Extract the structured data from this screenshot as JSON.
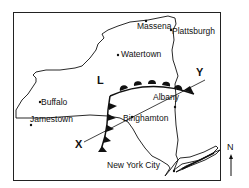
{
  "map": {
    "title": "New York State weather map",
    "cities": [
      {
        "name": "Massena"
      },
      {
        "name": "Plattsburgh"
      },
      {
        "name": "Watertown"
      },
      {
        "name": "Buffalo"
      },
      {
        "name": "Jamestown"
      },
      {
        "name": "Albany"
      },
      {
        "name": "Binghamton"
      },
      {
        "name": "New York City"
      }
    ],
    "pressure_center": {
      "label": "L"
    },
    "cross_section": {
      "start_label": "X",
      "end_label": "Y"
    },
    "fronts": [
      {
        "type": "warm-front",
        "symbol": "semicircles"
      },
      {
        "type": "cold-front",
        "symbol": "triangles"
      }
    ],
    "compass": {
      "label": "N"
    },
    "colors": {
      "line": "#111111",
      "background": "#ffffff"
    }
  }
}
